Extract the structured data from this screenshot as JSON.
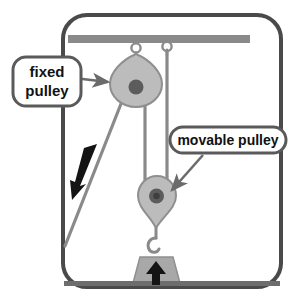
{
  "diagram": {
    "frame": {
      "name": "rounded-border-frame",
      "stroke_color": "#4a4a4a"
    },
    "ceiling_beam": {
      "name": "ceiling-beam",
      "color": "#8a8a8a"
    },
    "labels": [
      {
        "id": "fixed-pulley",
        "lines": [
          "fixed",
          "pulley"
        ],
        "text": "fixed pulley",
        "shape": "rounded-rect",
        "border_color": "#5a5a5a",
        "fill_color": "#ffffff",
        "text_color": "#111111",
        "arrow_color": "#6b6b6b",
        "arrow_direction": "right"
      },
      {
        "id": "movable-pulley",
        "lines": [
          "movable pulley"
        ],
        "text": "movable pulley",
        "shape": "pill",
        "border_color": "#5a5a5a",
        "fill_color": "#ffffff",
        "text_color": "#111111",
        "arrow_color": "#6b6b6b",
        "arrow_direction": "down-left"
      }
    ],
    "pulleys": [
      {
        "id": "fixed-pulley-body",
        "type": "fixed",
        "shape": "teardrop-point-up",
        "body_color": "#b9b9b9",
        "edge_color": "#8f8f8f",
        "hub_color": "#5c5c5c"
      },
      {
        "id": "movable-pulley-body",
        "type": "movable",
        "shape": "teardrop-point-down",
        "body_color": "#b9b9b9",
        "edge_color": "#8f8f8f",
        "hub_color": "#5c5c5c"
      }
    ],
    "ropes": {
      "name": "rope-lines",
      "color": "#8a8a8a",
      "segments": [
        "pull-end-diagonal-down-left",
        "fixed-pulley-to-movable-pulley-vertical",
        "ceiling-anchor-to-movable-pulley-vertical"
      ]
    },
    "eye_hooks": [
      {
        "id": "eye-hook-left",
        "color": "#8a8a8a"
      },
      {
        "id": "eye-hook-right",
        "color": "#8a8a8a"
      }
    ],
    "hook": {
      "id": "load-hook",
      "color": "#8a8a8a"
    },
    "weight": {
      "id": "load-weight",
      "shape": "trapezoid",
      "color": "#a8a8a8",
      "edge_color": "#8a8a8a"
    },
    "ground": {
      "id": "ground-line",
      "color": "#6d6d6d"
    },
    "arrows": [
      {
        "id": "effort-force-arrow",
        "label": "",
        "direction": "down-left",
        "color": "#141414"
      },
      {
        "id": "load-force-arrow",
        "label": "",
        "direction": "up",
        "color": "#141414"
      }
    ]
  }
}
